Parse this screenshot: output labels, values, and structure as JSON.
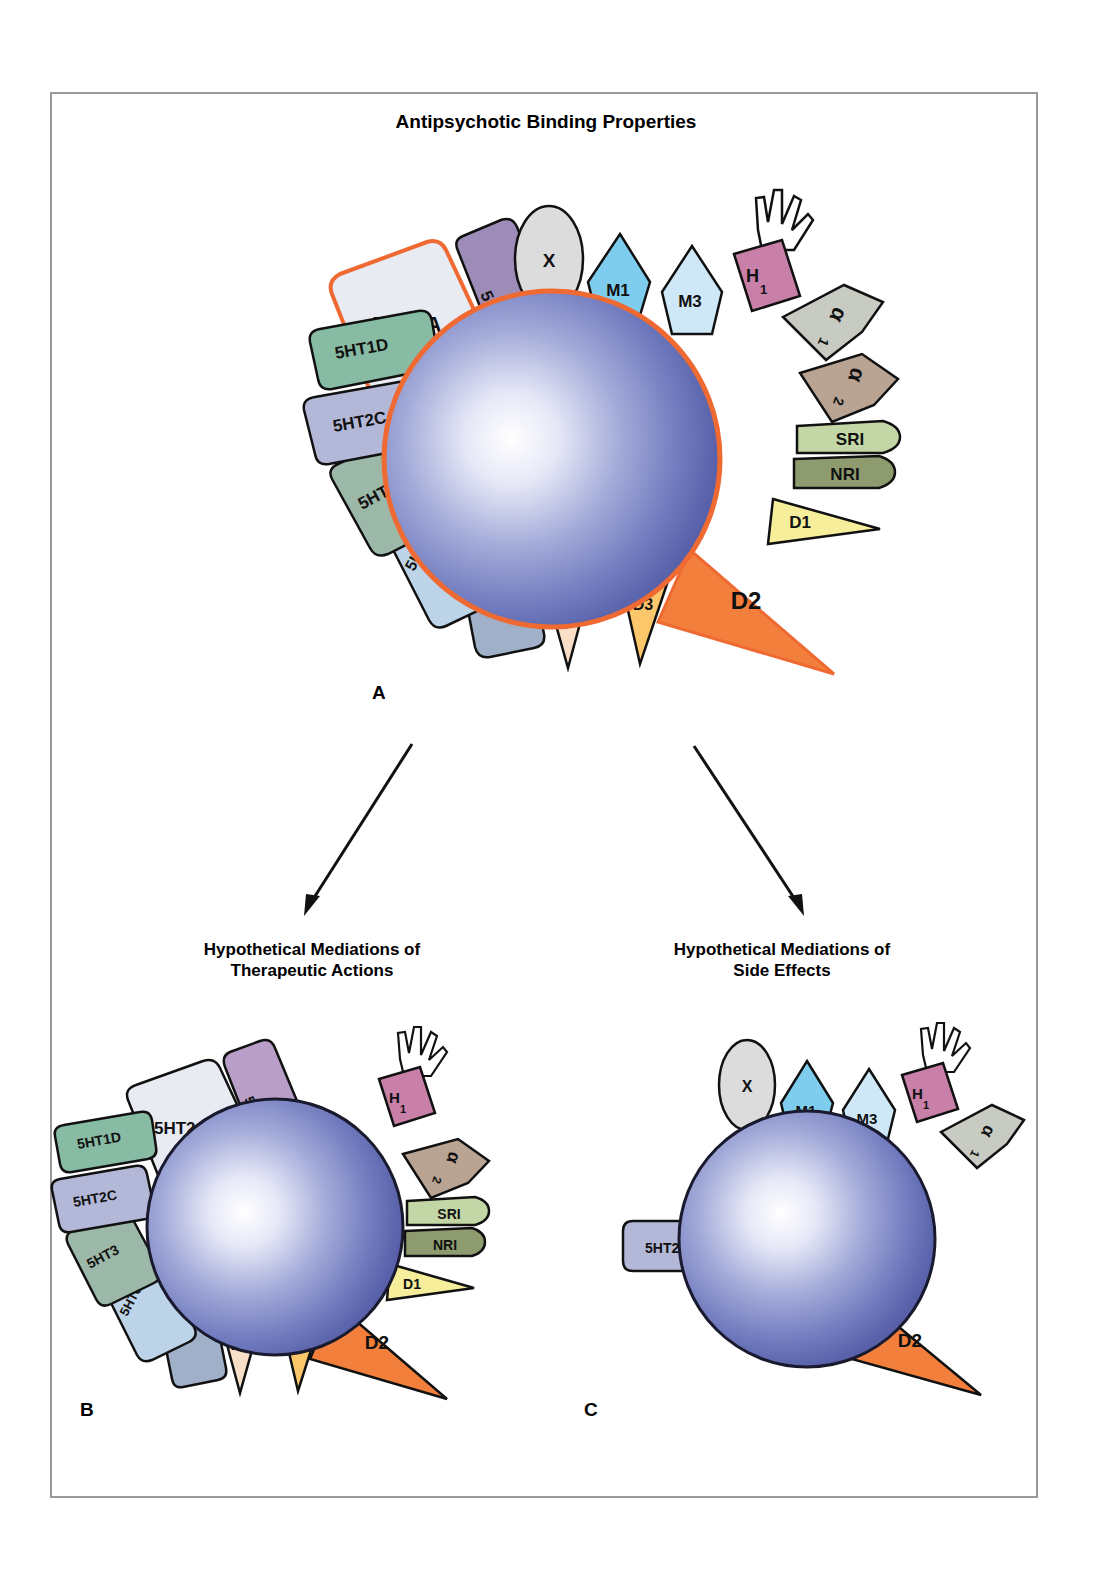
{
  "figure": {
    "panel_a": {
      "letter": "A",
      "title": "Antipsychotic Binding Properties",
      "receptors": [
        {
          "name": "5HT2A",
          "color": "#e8ebf2",
          "highlight": "#ef6a32",
          "shape": "rounded-bar"
        },
        {
          "name": "5HT1A",
          "color": "#9e8cb8",
          "shape": "rounded-bar"
        },
        {
          "name": "X",
          "color": "#dcdcdc",
          "shape": "ellipse"
        },
        {
          "name": "M1",
          "color": "#7fcdee",
          "shape": "diamond"
        },
        {
          "name": "M3",
          "color": "#cfe8f7",
          "shape": "diamond"
        },
        {
          "name": "H1",
          "color": "#c87fa8",
          "shape": "square-flame"
        },
        {
          "name": "alpha1",
          "label": "1",
          "color": "#c8cbc2",
          "shape": "pentagon"
        },
        {
          "name": "alpha2",
          "label": "2",
          "color": "#b9a392",
          "shape": "pentagon"
        },
        {
          "name": "SRI",
          "color": "#c3d6a6",
          "shape": "capsule"
        },
        {
          "name": "NRI",
          "color": "#8e9b6e",
          "shape": "capsule"
        },
        {
          "name": "D1",
          "color": "#f6ee9a",
          "shape": "triangle"
        },
        {
          "name": "D2",
          "color": "#f2803c",
          "shape": "big-triangle"
        },
        {
          "name": "D3",
          "color": "#fbc76a",
          "shape": "triangle"
        },
        {
          "name": "D4",
          "color": "#fadfc8",
          "shape": "triangle"
        },
        {
          "name": "5HT7",
          "color": "#9fb0c8",
          "shape": "rounded-bar"
        },
        {
          "name": "5HT6",
          "color": "#bdd3e8",
          "shape": "rounded-bar"
        },
        {
          "name": "5HT3",
          "color": "#9cb8a9",
          "shape": "rounded-bar"
        },
        {
          "name": "5HT2C",
          "color": "#b3b8d8",
          "shape": "rounded-bar"
        },
        {
          "name": "5HT1D",
          "color": "#87bba4",
          "shape": "rounded-bar"
        }
      ]
    },
    "panel_b": {
      "letter": "B",
      "title": "Hypothetical Mediations of\nTherapeutic Actions",
      "receptors": [
        {
          "name": "5HT2A",
          "color": "#e8ebf2"
        },
        {
          "name": "5HT1A",
          "color": "#b99fc7"
        },
        {
          "name": "H1",
          "color": "#c87fa8"
        },
        {
          "name": "alpha2",
          "label": "2",
          "color": "#b9a392"
        },
        {
          "name": "SRI",
          "color": "#c3d6a6"
        },
        {
          "name": "NRI",
          "color": "#8e9b6e"
        },
        {
          "name": "D1",
          "color": "#f6ee9a"
        },
        {
          "name": "D2",
          "color": "#f2803c"
        },
        {
          "name": "D3",
          "color": "#fbc76a"
        },
        {
          "name": "D4",
          "color": "#fadfc8"
        },
        {
          "name": "5HT7",
          "color": "#9fb0c8"
        },
        {
          "name": "5HT6",
          "color": "#bdd3e8"
        },
        {
          "name": "5HT3",
          "color": "#9cb8a9"
        },
        {
          "name": "5HT2C",
          "color": "#b3b8d8"
        },
        {
          "name": "5HT1D",
          "color": "#87bba4"
        }
      ]
    },
    "panel_c": {
      "letter": "C",
      "title": "Hypothetical Mediations of\nSide Effects",
      "receptors": [
        {
          "name": "X",
          "color": "#dcdcdc"
        },
        {
          "name": "M1",
          "color": "#7fcdee"
        },
        {
          "name": "M3",
          "color": "#cfe8f7"
        },
        {
          "name": "H1",
          "color": "#c87fa8"
        },
        {
          "name": "alpha1",
          "label": "1",
          "color": "#c8cbc2"
        },
        {
          "name": "5HT2C",
          "color": "#b3b8d8"
        },
        {
          "name": "D2",
          "color": "#f2803c"
        }
      ]
    },
    "sphere": {
      "highlight_color": "#ffffff",
      "edge_color": "#5760a8",
      "outline_a": "#ef6a32",
      "outline_bc": "#1a1a2e"
    },
    "arrows": {
      "left_arrow": "arrow-to-panel-b",
      "right_arrow": "arrow-to-panel-c"
    }
  },
  "labels": {
    "a5ht2a": "5HT2A",
    "a5ht1a": "5HT1A",
    "ax": "X",
    "am1": "M1",
    "am3": "M3",
    "ah1": "H",
    "ah1sub": "1",
    "aa1": "1",
    "aa2": "2",
    "asri": "SRI",
    "anri": "NRI",
    "ad1": "D1",
    "ad2": "D2",
    "ad3": "D3",
    "ad4": "D4",
    "a5ht7": "5HT7",
    "a5ht6": "5HT6",
    "a5ht3": "5HT3",
    "a5ht2c": "5HT2C",
    "a5ht1d": "5HT1D",
    "alpha_glyph": "α"
  }
}
